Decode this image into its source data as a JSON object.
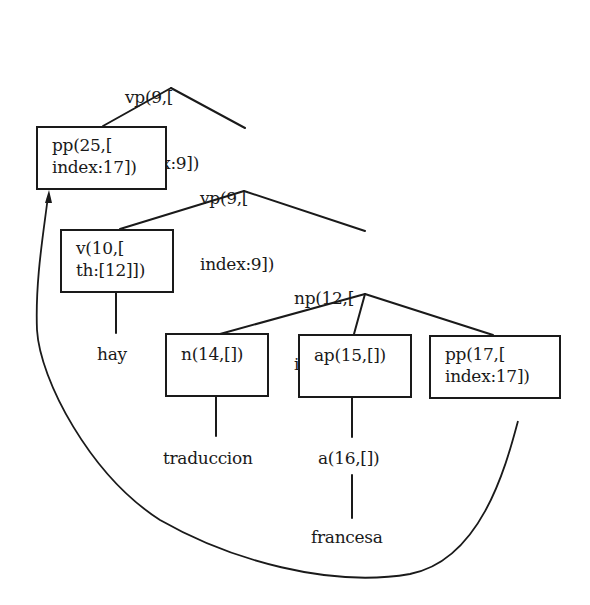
{
  "diagram": {
    "type": "parse-tree",
    "colors": {
      "ink": "#1a1a1a",
      "background": "#ffffff"
    },
    "nodes": {
      "root_vp": {
        "line1": "vp(9,[",
        "line2": "index:9])",
        "boxed": false
      },
      "pp25": {
        "line1": "pp(25,[",
        "line2": "index:17])",
        "boxed": true
      },
      "vp9_inner": {
        "line1": "vp(9,[",
        "line2": "index:9])",
        "boxed": false
      },
      "v10": {
        "line1": "v(10,[",
        "line2": "th:[12]])",
        "boxed": true
      },
      "np12": {
        "line1": "np(12,[",
        "line2": "index:12])",
        "boxed": false
      },
      "n14": {
        "line1": "n(14,[])",
        "boxed": true
      },
      "ap15": {
        "line1": "ap(15,[])",
        "boxed": true
      },
      "pp17": {
        "line1": "pp(17,[",
        "line2": "index:17])",
        "boxed": true
      },
      "a16": {
        "line1": "a(16,[])",
        "boxed": false
      }
    },
    "leaves": {
      "hay": "hay",
      "traduccion": "traduccion",
      "francesa": "francesa"
    },
    "edges": [
      [
        "root_vp",
        "pp25"
      ],
      [
        "root_vp",
        "vp9_inner"
      ],
      [
        "vp9_inner",
        "v10"
      ],
      [
        "vp9_inner",
        "np12"
      ],
      [
        "v10",
        "hay"
      ],
      [
        "np12",
        "n14"
      ],
      [
        "np12",
        "ap15"
      ],
      [
        "np12",
        "pp17"
      ],
      [
        "n14",
        "traduccion"
      ],
      [
        "ap15",
        "a16"
      ],
      [
        "a16",
        "francesa"
      ]
    ],
    "movement_arrow": {
      "from": "pp17",
      "to": "pp25"
    }
  }
}
